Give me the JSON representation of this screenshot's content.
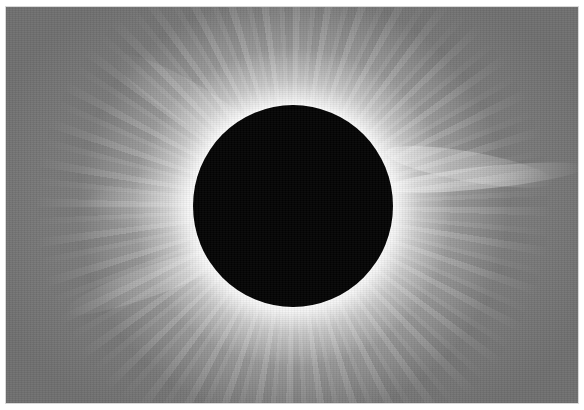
{
  "image": {
    "subject": "Total solar eclipse with white coronal streamers around the dark lunar disk",
    "alt": "Total solar eclipse corona",
    "colors": {
      "background_sky": "#6f6f6f",
      "corona": "#f2f2f2",
      "moon_disk": "#030303",
      "frame": "#ffffff"
    },
    "moon_disk": {
      "center_x": 293,
      "center_y": 207,
      "radius": 100
    }
  }
}
